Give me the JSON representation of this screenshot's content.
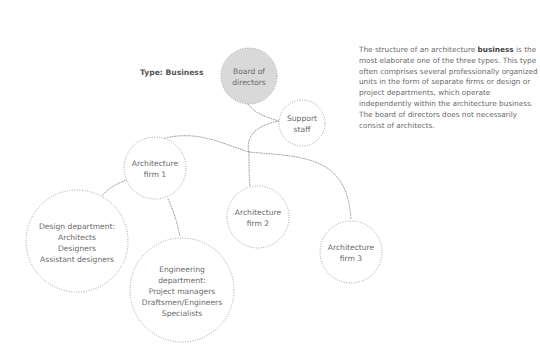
{
  "type_label": "Type: Business",
  "description": {
    "before_bold": "The structure of an architecture ",
    "bold": "business",
    "after_bold": " is the most elaborate one of the three types. This type often comprises several professionally organized units in the form of separate firms or design or project departments, which operate independently within the architecture business. The board of directors does not necessarily consist of architects."
  },
  "colors": {
    "board_fill": "#d9d9d9",
    "dotted_stroke": "#8c8c8c",
    "text": "#6a6a6a"
  },
  "nodes": [
    {
      "id": "board",
      "lines": [
        "Board of",
        "directors"
      ],
      "filled": true
    },
    {
      "id": "support",
      "lines": [
        "Support",
        "staff"
      ],
      "filled": false
    },
    {
      "id": "firm1",
      "lines": [
        "Architecture",
        "firm 1"
      ],
      "filled": false
    },
    {
      "id": "firm2",
      "lines": [
        "Architecture",
        "firm 2"
      ],
      "filled": false
    },
    {
      "id": "firm3",
      "lines": [
        "Architecture",
        "firm 3"
      ],
      "filled": false
    },
    {
      "id": "design",
      "lines": [
        "Design department:",
        "Architects",
        "Designers",
        "Assistant designers"
      ],
      "filled": false
    },
    {
      "id": "engineering",
      "lines": [
        "Engineering",
        "department:",
        "Project managers",
        "Draftsmen/Engineers",
        "Specialists"
      ],
      "filled": false
    }
  ],
  "edges": [
    {
      "from": "board",
      "to": "support"
    },
    {
      "from": "support",
      "to": "firm1"
    },
    {
      "from": "support",
      "to": "firm2"
    },
    {
      "from": "support",
      "to": "firm3"
    },
    {
      "from": "firm1",
      "to": "design"
    },
    {
      "from": "firm1",
      "to": "engineering"
    }
  ]
}
